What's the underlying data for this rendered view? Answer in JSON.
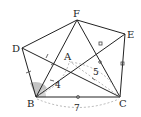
{
  "diagram": {
    "type": "geometry-figure",
    "points": {
      "F": {
        "label": "F",
        "x": 77,
        "y": 20
      },
      "E": {
        "label": "E",
        "x": 125,
        "y": 34
      },
      "D": {
        "label": "D",
        "x": 22,
        "y": 48
      },
      "A": {
        "label": "A",
        "x": 69,
        "y": 61
      },
      "B": {
        "label": "B",
        "x": 36,
        "y": 97
      },
      "C": {
        "label": "C",
        "x": 120,
        "y": 97
      }
    },
    "segments": [
      "DF",
      "FE",
      "EC",
      "BC",
      "DB",
      "DC",
      "BF",
      "FC",
      "BE",
      "BA",
      "AC"
    ],
    "measurements": {
      "AB": "4",
      "AC": "5",
      "BC": "7"
    },
    "colors": {
      "line": "#222222",
      "angle_fill": "#bbbbbb",
      "dashed": "#999999"
    }
  }
}
